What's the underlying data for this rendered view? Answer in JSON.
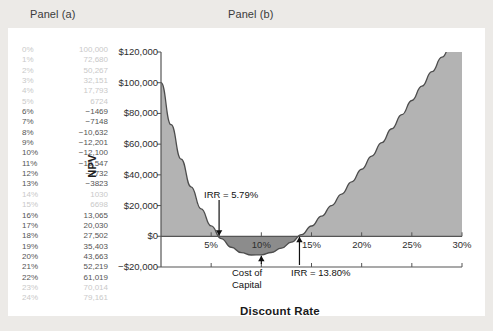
{
  "panels": {
    "a_title": "Panel (a)",
    "b_title": "Panel (b)"
  },
  "table": {
    "rows": [
      {
        "rate": "0%",
        "npv": "100,000"
      },
      {
        "rate": "1%",
        "npv": "72,680"
      },
      {
        "rate": "2%",
        "npv": "50,267"
      },
      {
        "rate": "3%",
        "npv": "32,151"
      },
      {
        "rate": "4%",
        "npv": "17,793"
      },
      {
        "rate": "5%",
        "npv": "6724"
      },
      {
        "rate": "6%",
        "npv": "−1469"
      },
      {
        "rate": "7%",
        "npv": "−7148"
      },
      {
        "rate": "8%",
        "npv": "−10,632"
      },
      {
        "rate": "9%",
        "npv": "−12,201"
      },
      {
        "rate": "10%",
        "npv": "−12,100"
      },
      {
        "rate": "11%",
        "npv": "−10,547"
      },
      {
        "rate": "12%",
        "npv": "−7732"
      },
      {
        "rate": "13%",
        "npv": "−3823"
      },
      {
        "rate": "14%",
        "npv": "1030"
      },
      {
        "rate": "15%",
        "npv": "6698"
      },
      {
        "rate": "16%",
        "npv": "13,065"
      },
      {
        "rate": "17%",
        "npv": "20,030"
      },
      {
        "rate": "18%",
        "npv": "27,502"
      },
      {
        "rate": "19%",
        "npv": "35,403"
      },
      {
        "rate": "20%",
        "npv": "43,663"
      },
      {
        "rate": "21%",
        "npv": "52,219"
      },
      {
        "rate": "22%",
        "npv": "61,019"
      },
      {
        "rate": "23%",
        "npv": "70,014"
      },
      {
        "rate": "24%",
        "npv": "79,161"
      }
    ]
  },
  "chart_data": {
    "type": "area",
    "title": "Panel (b)",
    "xlabel": "Discount Rate",
    "ylabel": "NPV",
    "xlim": [
      0,
      30
    ],
    "ylim": [
      -20000,
      120000
    ],
    "xticks": [
      "5%",
      "10%",
      "15%",
      "20%",
      "25%",
      "30%"
    ],
    "xtick_values": [
      5,
      10,
      15,
      20,
      25,
      30
    ],
    "yticks": [
      "$120,000",
      "$100,000",
      "$80,000",
      "$60,000",
      "$40,000",
      "$20,000",
      "$0",
      "−$20,000"
    ],
    "ytick_values": [
      120000,
      100000,
      80000,
      60000,
      40000,
      20000,
      0,
      -20000
    ],
    "grid": false,
    "legend": "none",
    "x": [
      0,
      1,
      2,
      3,
      4,
      5,
      6,
      7,
      8,
      9,
      10,
      11,
      12,
      13,
      14,
      15,
      16,
      17,
      18,
      19,
      20,
      21,
      22,
      23,
      24,
      25,
      26,
      27,
      28,
      29,
      30
    ],
    "values": [
      100000,
      72680,
      50267,
      32151,
      17793,
      6724,
      -1469,
      -7148,
      -10632,
      -12201,
      -12100,
      -10547,
      -7732,
      -3823,
      1030,
      6698,
      13065,
      20030,
      27502,
      35403,
      43663,
      52219,
      61019,
      70014,
      79161,
      88420,
      97760,
      107160,
      116600,
      126060,
      135540
    ],
    "annotations": [
      {
        "label": "IRR = 5.79%",
        "x": 5.79,
        "y": 0,
        "arrow": "down"
      },
      {
        "label": "IRR = 13.80%",
        "x": 13.8,
        "y": 0,
        "arrow": "up"
      },
      {
        "label": "Cost of Capital",
        "x": 10,
        "y": -12100,
        "arrow": "up"
      }
    ],
    "colors": {
      "area_positive": "#b3b3b3",
      "area_negative": "#8c8c8c",
      "line": "#4d4d4d",
      "axis": "#555555"
    }
  },
  "annotations": {
    "irr_low": "IRR = 5.79%",
    "irr_high": "IRR = 13.80%",
    "cost_line1": "Cost of",
    "cost_line2": "Capital"
  }
}
